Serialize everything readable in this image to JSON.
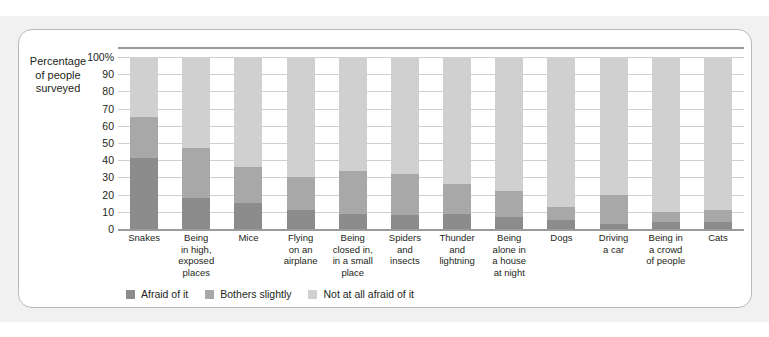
{
  "top_fragment": "",
  "axis_title": "Percentage\nof people\nsurveyed",
  "axis_title_lines": [
    "Percentage",
    "of people",
    "surveyed"
  ],
  "chart_data": {
    "type": "bar",
    "subtype": "stacked-100-percent",
    "orientation": "vertical",
    "title": "",
    "xlabel": "",
    "ylabel": "Percentage of people surveyed",
    "ylim": [
      0,
      100
    ],
    "yticks": [
      0,
      10,
      20,
      30,
      40,
      50,
      60,
      70,
      80,
      90,
      100
    ],
    "ytick_labels": [
      "0",
      "10",
      "20",
      "30",
      "40",
      "50",
      "60",
      "70",
      "80",
      "90",
      "100%"
    ],
    "grid": true,
    "legend_position": "bottom-left",
    "categories": [
      "Snakes",
      "Being in high, exposed places",
      "Mice",
      "Flying on an airplane",
      "Being closed in, in a small place",
      "Spiders and insects",
      "Thunder and lightning",
      "Being alone in a house at night",
      "Dogs",
      "Driving a car",
      "Being in a crowd of people",
      "Cats"
    ],
    "category_label_lines": [
      [
        "Snakes"
      ],
      [
        "Being",
        "in high,",
        "exposed",
        "places"
      ],
      [
        "Mice"
      ],
      [
        "Flying",
        "on an",
        "airplane"
      ],
      [
        "Being",
        "closed in,",
        "in a small",
        "place"
      ],
      [
        "Spiders",
        "and",
        "insects"
      ],
      [
        "Thunder",
        "and",
        "lightning"
      ],
      [
        "Being",
        "alone in",
        "a house",
        "at night"
      ],
      [
        "Dogs"
      ],
      [
        "Driving",
        "a car"
      ],
      [
        "Being in",
        "a crowd",
        "of people"
      ],
      [
        "Cats"
      ]
    ],
    "series": [
      {
        "name": "Afraid of it",
        "color": "#8c8c8c",
        "values": [
          41,
          18,
          15,
          11,
          9,
          8,
          9,
          7,
          5,
          3,
          4,
          4
        ]
      },
      {
        "name": "Bothers slightly",
        "color": "#a8a8a8",
        "values": [
          24,
          29,
          21,
          19,
          25,
          24,
          17,
          15,
          8,
          17,
          6,
          7
        ]
      },
      {
        "name": "Not at all afraid of it",
        "color": "#d0d0d0",
        "values": [
          35,
          53,
          64,
          70,
          66,
          68,
          74,
          78,
          87,
          80,
          90,
          89
        ]
      }
    ]
  },
  "legend": [
    {
      "label": "Afraid of it",
      "color": "#8c8c8c"
    },
    {
      "label": "Bothers slightly",
      "color": "#a8a8a8"
    },
    {
      "label": "Not at all afraid of it",
      "color": "#d0d0d0"
    }
  ]
}
